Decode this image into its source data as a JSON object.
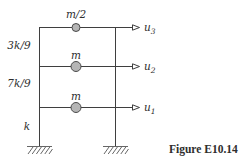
{
  "figure": {
    "caption": "Figure E10.14"
  },
  "colors": {
    "background": "#ffffff",
    "line": "#3f3f3f",
    "text": "#2e2e2e",
    "mass_fill": "#b5b5b5",
    "mass_stroke": "#4a4a4a"
  },
  "diagram": {
    "type": "three-story-shear-frame",
    "mass_labels": [
      "m/2",
      "m",
      "m"
    ],
    "story_stiffness_labels": [
      "3k/9",
      "7k/9",
      "k"
    ],
    "dof_labels": [
      {
        "base": "u",
        "sub": "3"
      },
      {
        "base": "u",
        "sub": "2"
      },
      {
        "base": "u",
        "sub": "1"
      }
    ]
  }
}
